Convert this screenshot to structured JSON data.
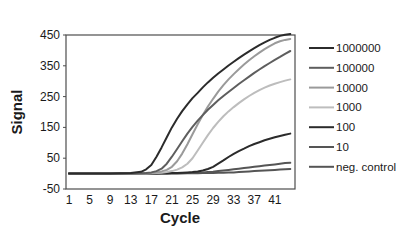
{
  "chart_data": {
    "type": "line",
    "title": "",
    "xlabel": "Cycle",
    "ylabel": "Signal",
    "xlim": [
      1,
      44
    ],
    "ylim": [
      -50,
      450
    ],
    "x_ticks": [
      1,
      5,
      9,
      13,
      17,
      21,
      25,
      29,
      33,
      37,
      41
    ],
    "y_ticks": [
      -50,
      50,
      150,
      250,
      350,
      450
    ],
    "grid": false,
    "legend_position": "right",
    "x": [
      1,
      5,
      9,
      13,
      15,
      16,
      17,
      18,
      19,
      20,
      21,
      22,
      23,
      24,
      25,
      26,
      27,
      28,
      29,
      30,
      31,
      32,
      33,
      34,
      35,
      36,
      37,
      38,
      39,
      40,
      41,
      42,
      43,
      44
    ],
    "series": [
      {
        "name": "1000000",
        "color": "#2b2b2b",
        "values": [
          0,
          0,
          0,
          2,
          6,
          14,
          28,
          55,
          85,
          118,
          150,
          178,
          203,
          225,
          245,
          262,
          280,
          296,
          311,
          325,
          338,
          351,
          363,
          375,
          386,
          397,
          407,
          417,
          426,
          434,
          441,
          447,
          451,
          453
        ]
      },
      {
        "name": "100000",
        "color": "#5e5e5e",
        "values": [
          0,
          0,
          0,
          0,
          1,
          2,
          4,
          8,
          16,
          32,
          55,
          80,
          105,
          130,
          152,
          172,
          190,
          207,
          223,
          238,
          252,
          265,
          278,
          291,
          303,
          315,
          327,
          338,
          349,
          359,
          369,
          379,
          389,
          398
        ]
      },
      {
        "name": "10000",
        "color": "#9a9a9a",
        "values": [
          0,
          0,
          0,
          0,
          0,
          1,
          2,
          4,
          7,
          12,
          22,
          40,
          65,
          95,
          128,
          160,
          190,
          218,
          243,
          266,
          287,
          306,
          323,
          339,
          354,
          368,
          381,
          393,
          404,
          414,
          423,
          430,
          434,
          437
        ]
      },
      {
        "name": "1000",
        "color": "#bdbdbd",
        "values": [
          0,
          0,
          0,
          0,
          0,
          0,
          1,
          2,
          3,
          5,
          8,
          13,
          20,
          32,
          50,
          75,
          100,
          125,
          148,
          168,
          186,
          202,
          216,
          229,
          241,
          252,
          262,
          271,
          279,
          286,
          292,
          297,
          302,
          306
        ]
      },
      {
        "name": "100",
        "color": "#2b2b2b",
        "values": [
          0,
          0,
          0,
          0,
          0,
          0,
          0,
          0,
          1,
          1,
          2,
          2,
          3,
          4,
          5,
          7,
          10,
          15,
          22,
          32,
          43,
          54,
          64,
          73,
          81,
          89,
          96,
          102,
          108,
          113,
          118,
          122,
          126,
          130
        ]
      },
      {
        "name": "10",
        "color": "#555555",
        "values": [
          0,
          0,
          0,
          0,
          0,
          0,
          0,
          0,
          0,
          0,
          1,
          1,
          1,
          2,
          2,
          3,
          4,
          5,
          6,
          8,
          10,
          12,
          14,
          16,
          18,
          20,
          22,
          24,
          26,
          28,
          30,
          32,
          34,
          35
        ]
      },
      {
        "name": "neg. control",
        "color": "#555555",
        "values": [
          0,
          0,
          0,
          0,
          0,
          0,
          0,
          0,
          0,
          0,
          0,
          0,
          1,
          1,
          1,
          1,
          2,
          2,
          2,
          3,
          3,
          4,
          4,
          5,
          6,
          7,
          8,
          9,
          10,
          11,
          12,
          13,
          14,
          15
        ]
      }
    ]
  },
  "plot": {
    "left": 66,
    "top": 35,
    "right": 295,
    "bottom": 189,
    "x_min": 1,
    "x_max": 45.5,
    "y_min": -50,
    "y_max": 450,
    "border_color": "#4d4d4d"
  }
}
